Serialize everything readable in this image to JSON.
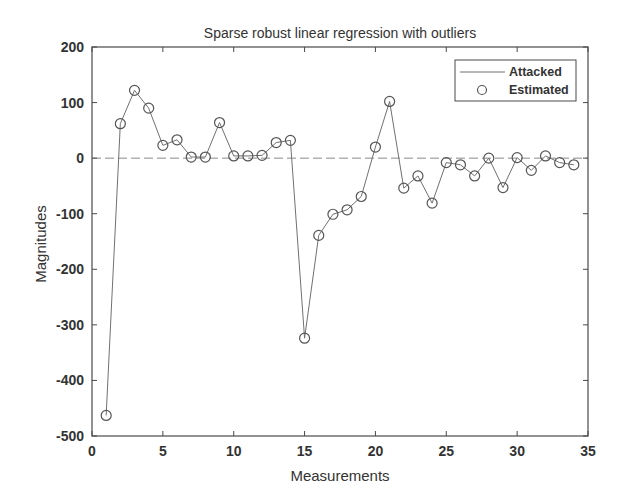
{
  "chart_data": {
    "type": "line",
    "title": "Sparse robust linear regression with outliers",
    "xlabel": "Measurements",
    "ylabel": "Magnitudes",
    "xlim": [
      0,
      35
    ],
    "ylim": [
      -500,
      200
    ],
    "xticks": [
      0,
      5,
      10,
      15,
      20,
      25,
      30,
      35
    ],
    "yticks": [
      200,
      100,
      0,
      -100,
      -200,
      -300,
      -400,
      -500
    ],
    "grid": false,
    "legend_position": "upper right",
    "reference_line": {
      "y": 0,
      "style": "dashed"
    },
    "x": [
      1,
      2,
      3,
      4,
      5,
      6,
      7,
      8,
      9,
      10,
      11,
      12,
      13,
      14,
      15,
      16,
      17,
      18,
      19,
      20,
      21,
      22,
      23,
      24,
      25,
      26,
      27,
      28,
      29,
      30,
      31,
      32,
      33,
      34
    ],
    "series": [
      {
        "name": "Attacked",
        "style": "line",
        "values": [
          -463,
          62,
          122,
          90,
          23,
          33,
          2,
          2,
          64,
          4,
          4,
          5,
          28,
          32,
          -324,
          -139,
          -101,
          -93,
          -69,
          20,
          102,
          -54,
          -32,
          -81,
          -8,
          -12,
          -32,
          0,
          -53,
          1,
          -22,
          4,
          -8,
          -12
        ]
      },
      {
        "name": "Estimated",
        "style": "circle-markers",
        "values": [
          -463,
          62,
          122,
          90,
          23,
          33,
          2,
          2,
          64,
          4,
          4,
          5,
          28,
          32,
          -324,
          -139,
          -101,
          -93,
          -69,
          20,
          102,
          -54,
          -32,
          -81,
          -8,
          -12,
          -32,
          0,
          -53,
          1,
          -22,
          4,
          -8,
          -12
        ]
      }
    ]
  },
  "colors": {
    "axis": "#4a4a4a",
    "line": "#707070",
    "marker": "#555555",
    "zero_line": "#8a8a8a",
    "text": "#333333"
  }
}
